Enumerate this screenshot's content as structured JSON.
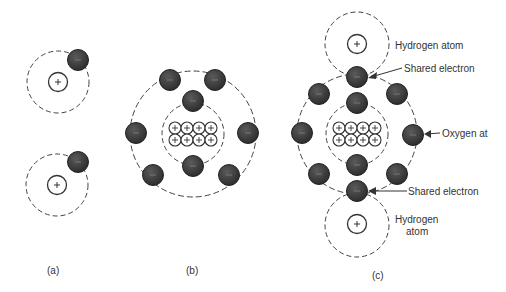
{
  "figure": {
    "panels": [
      {
        "id": "a",
        "caption": "(a)",
        "description": "Two separate hydrogen atoms, each with one nucleus (+) and one electron (−)"
      },
      {
        "id": "b",
        "caption": "(b)",
        "description": "Oxygen atom with 8 protons in nucleus, 2 inner-shell and 6 outer-shell electrons"
      },
      {
        "id": "c",
        "caption": "(c)",
        "description": "Water molecule: oxygen atom sharing electrons with two hydrogen atoms"
      }
    ],
    "labels": {
      "hydrogen_top": "Hydrogen atom",
      "shared_top": "Shared electron",
      "oxygen": "Oxygen at",
      "shared_bottom": "Shared electron",
      "hydrogen_bottom_line1": "Hydrogen",
      "hydrogen_bottom_line2": "atom"
    },
    "symbols": {
      "proton": "+",
      "electron": "−"
    },
    "colors": {
      "electron_fill": "#3a3a3a",
      "line": "#333333",
      "background": "#ffffff"
    }
  }
}
